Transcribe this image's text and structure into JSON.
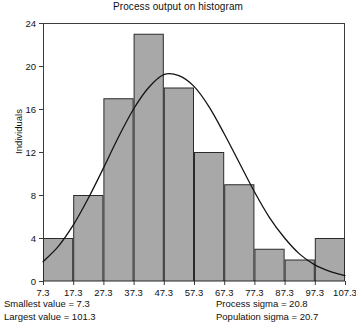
{
  "chart_data": {
    "type": "bar",
    "title": "Process output on histogram",
    "xlabel": "",
    "ylabel": "Individuals",
    "grid": false,
    "legend": "none",
    "bin_edges": [
      7.3,
      17.3,
      27.3,
      37.3,
      47.3,
      57.3,
      67.3,
      77.3,
      87.3,
      97.3,
      107.3
    ],
    "categories": [
      "7.3-17.3",
      "17.3-27.3",
      "27.3-37.3",
      "37.3-47.3",
      "47.3-57.3",
      "57.3-67.3",
      "67.3-77.3",
      "77.3-87.3",
      "87.3-97.3",
      "97.3-107.3"
    ],
    "values": [
      4,
      8,
      17,
      23,
      18,
      12,
      9,
      3,
      2,
      4
    ],
    "xticks": [
      "7.3",
      "17.3",
      "27.3",
      "37.3",
      "47.3",
      "57.3",
      "67.3",
      "77.3",
      "87.3",
      "97.3",
      "107.3"
    ],
    "yticks": [
      0,
      4,
      8,
      12,
      16,
      20,
      24
    ],
    "ylim": [
      0,
      24
    ],
    "xlim": [
      7.3,
      107.3
    ],
    "overlay_curve": {
      "name": "normal-distribution-curve",
      "mean": 47.5,
      "sigma": 20.8,
      "peak_value": 19.2,
      "points": [
        [
          7.3,
          1.8
        ],
        [
          12.3,
          3.2
        ],
        [
          17.3,
          5.2
        ],
        [
          22.3,
          7.7
        ],
        [
          27.3,
          10.5
        ],
        [
          32.3,
          13.4
        ],
        [
          37.3,
          16.0
        ],
        [
          42.3,
          18.0
        ],
        [
          47.3,
          19.2
        ],
        [
          52.3,
          19.1
        ],
        [
          57.3,
          18.1
        ],
        [
          62.3,
          16.2
        ],
        [
          67.3,
          13.7
        ],
        [
          72.3,
          11.0
        ],
        [
          77.3,
          8.3
        ],
        [
          82.3,
          5.9
        ],
        [
          87.3,
          4.0
        ],
        [
          92.3,
          2.5
        ],
        [
          97.3,
          1.5
        ],
        [
          102.3,
          0.9
        ],
        [
          107.3,
          0.5
        ]
      ]
    },
    "bar_fill_color": "#a8a8a8",
    "bar_edge_color": "#2b2b2b",
    "curve_color": "#141414",
    "axis_color": "#3d3d3d"
  },
  "footer": {
    "left": [
      "Smallest value = 7.3",
      "Largest value = 101.3"
    ],
    "right": [
      "Process sigma = 20.8",
      "Population sigma = 20.7"
    ]
  }
}
